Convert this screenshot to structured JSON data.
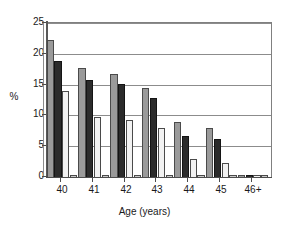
{
  "chart_data": {
    "type": "bar",
    "title": "",
    "xlabel": "Age (years)",
    "ylabel": "%",
    "categories": [
      "40",
      "41",
      "42",
      "43",
      "44",
      "45",
      "46+"
    ],
    "ylim": [
      0,
      25
    ],
    "yticks": [
      0,
      5,
      10,
      15,
      20,
      25
    ],
    "ytick_labels": [
      "0",
      "5",
      "10",
      "15",
      "20",
      "25"
    ],
    "grid": true,
    "legend": "none",
    "series": [
      {
        "name": "series-1",
        "color": "#9a9a9a",
        "values": [
          22.2,
          17.7,
          16.8,
          14.5,
          9.0,
          7.9,
          0.3
        ]
      },
      {
        "name": "series-2",
        "color": "#2b2b2b",
        "values": [
          18.8,
          15.7,
          15.1,
          12.8,
          6.6,
          6.1,
          0.3
        ]
      },
      {
        "name": "series-3",
        "color": "#f2f2f2",
        "values": [
          14.0,
          9.8,
          9.3,
          7.9,
          2.9,
          2.2,
          0.3
        ]
      },
      {
        "name": "series-4",
        "color": "#c9c9c9",
        "values": [
          0.3,
          0.3,
          0.3,
          0.3,
          0.3,
          0.3,
          0.4
        ]
      }
    ]
  },
  "axis": {
    "ylabel_text": "%",
    "xlabel_text": "Age (years)"
  }
}
